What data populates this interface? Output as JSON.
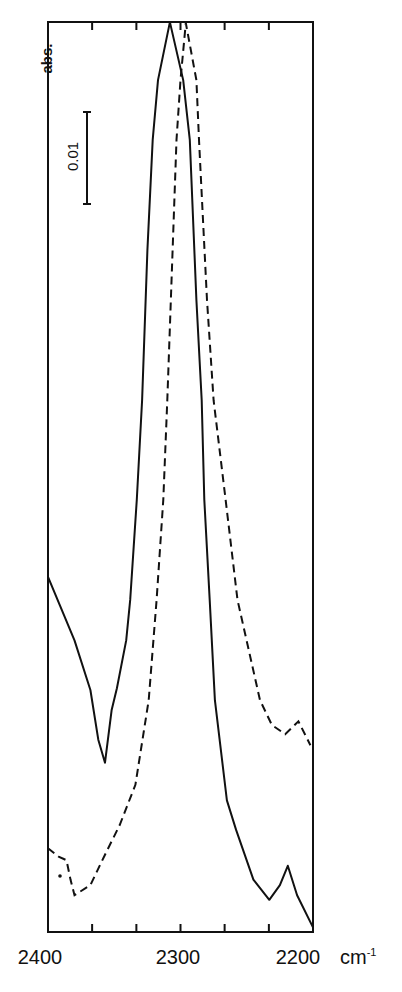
{
  "chart_data": {
    "type": "line",
    "title": "",
    "xlabel": "cm-1",
    "ylabel": "abs.",
    "xlim": [
      2400,
      2200
    ],
    "x_reversed": true,
    "x_tick_labels": [
      "2400",
      "2300",
      "2200"
    ],
    "x_minor_ticks": [
      2400,
      2366.7,
      2333.3,
      2300,
      2266.7,
      2233.3,
      2200
    ],
    "y_scale_bar": {
      "label": "0.01",
      "value": 0.01
    },
    "ylim": [
      0,
      0.1
    ],
    "grid": false,
    "legend": null,
    "series": [
      {
        "name": "solid",
        "style": "solid",
        "x": [
          2400,
          2391,
          2380,
          2368,
          2362,
          2357,
          2352,
          2348,
          2341,
          2338,
          2333,
          2329,
          2325,
          2321,
          2317,
          2308,
          2298,
          2293,
          2288,
          2284,
          2282,
          2278,
          2274,
          2265,
          2258,
          2245,
          2233,
          2225,
          2219,
          2212,
          2200
        ],
        "y": [
          0.0386,
          0.0355,
          0.0317,
          0.0263,
          0.0209,
          0.0184,
          0.0241,
          0.0265,
          0.0317,
          0.0361,
          0.047,
          0.0578,
          0.0741,
          0.0861,
          0.0926,
          0.0989,
          0.0926,
          0.0861,
          0.0687,
          0.0578,
          0.047,
          0.0361,
          0.0252,
          0.0143,
          0.0111,
          0.0057,
          0.0035,
          0.0051,
          0.0072,
          0.004,
          0.0005
        ]
      },
      {
        "name": "dashed",
        "style": "dashed",
        "x": [
          2400,
          2392,
          2386,
          2383,
          2380,
          2368,
          2357,
          2346,
          2334,
          2324,
          2318,
          2313,
          2310,
          2306,
          2303,
          2300,
          2296,
          2288,
          2286,
          2280,
          2275,
          2266,
          2257,
          2240,
          2231,
          2221,
          2211,
          2202
        ],
        "y": [
          0.0091,
          0.0082,
          0.0078,
          0.0057,
          0.004,
          0.0051,
          0.0084,
          0.0116,
          0.016,
          0.0252,
          0.0361,
          0.047,
          0.0578,
          0.0741,
          0.0861,
          0.0926,
          0.0988,
          0.0926,
          0.0861,
          0.0687,
          0.0578,
          0.047,
          0.0361,
          0.0252,
          0.0225,
          0.0215,
          0.0229,
          0.0203
        ]
      }
    ],
    "annotations": [
      {
        "text": "0.01",
        "type": "scale-bar"
      },
      {
        "text": "•",
        "type": "stray-dot",
        "x": 2391,
        "y": 0.0061
      }
    ]
  },
  "labels": {
    "ylabel": "abs.",
    "scale": "0.01",
    "x2400": "2400",
    "x2300": "2300",
    "x2200": "2200",
    "unit_base": "cm",
    "unit_sup": "-1"
  }
}
